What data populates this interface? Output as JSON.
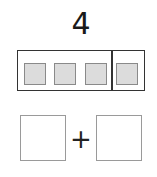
{
  "number": "4",
  "ten_frame": {
    "filled_cells": 4,
    "left_group_count": 3,
    "right_group_count": 1,
    "cell_color": "#dcdcdc"
  },
  "equation": {
    "operator": "+",
    "left_box_value": "",
    "right_box_value": ""
  }
}
